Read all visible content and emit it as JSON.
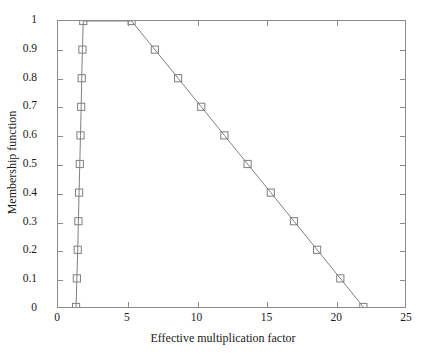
{
  "chart_data": {
    "type": "line",
    "title": "",
    "xlabel": "Effective multiplication factor",
    "ylabel": "Membership function",
    "xlim": [
      0,
      25
    ],
    "ylim": [
      0,
      1
    ],
    "xticks": [
      0,
      5,
      10,
      15,
      20,
      25
    ],
    "xtick_labels": [
      "0",
      "5",
      "10",
      "15",
      "20",
      "25"
    ],
    "yticks": [
      0,
      0.1,
      0.2,
      0.3,
      0.4,
      0.5,
      0.6,
      0.7,
      0.8,
      0.9,
      1
    ],
    "ytick_labels": [
      "0",
      "0.1",
      "0.2",
      "0.3",
      "0.4",
      "0.5",
      "0.6",
      "0.7",
      "0.8",
      "0.9",
      "1"
    ],
    "grid": false,
    "legend": null,
    "marker": "open-square",
    "line_color": "#7f7f7f",
    "marker_color": "#7f7f7f",
    "axis_color": "#8c8c8c",
    "series": [
      {
        "name": "Membership function (triangular-trapezoidal)",
        "points": [
          {
            "x": 1.3,
            "y": 0.0
          },
          {
            "x": 1.36,
            "y": 0.1
          },
          {
            "x": 1.42,
            "y": 0.2
          },
          {
            "x": 1.47,
            "y": 0.3
          },
          {
            "x": 1.52,
            "y": 0.4
          },
          {
            "x": 1.57,
            "y": 0.5
          },
          {
            "x": 1.62,
            "y": 0.6
          },
          {
            "x": 1.67,
            "y": 0.7
          },
          {
            "x": 1.71,
            "y": 0.8
          },
          {
            "x": 1.76,
            "y": 0.9
          },
          {
            "x": 1.82,
            "y": 1.0
          },
          {
            "x": 5.3,
            "y": 1.0
          },
          {
            "x": 6.98,
            "y": 0.9
          },
          {
            "x": 8.65,
            "y": 0.8
          },
          {
            "x": 10.32,
            "y": 0.7
          },
          {
            "x": 11.99,
            "y": 0.6
          },
          {
            "x": 13.66,
            "y": 0.5
          },
          {
            "x": 15.33,
            "y": 0.4
          },
          {
            "x": 17.0,
            "y": 0.3
          },
          {
            "x": 18.67,
            "y": 0.2
          },
          {
            "x": 20.34,
            "y": 0.1
          },
          {
            "x": 22.0,
            "y": 0.0
          }
        ]
      }
    ]
  }
}
